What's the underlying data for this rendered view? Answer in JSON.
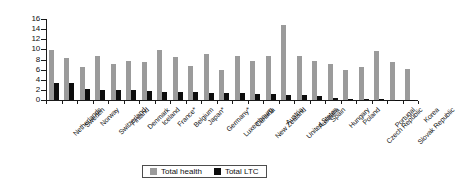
{
  "chart_data": {
    "type": "bar",
    "title": "",
    "subtitle": "",
    "xlabel": "",
    "ylabel": "",
    "ylim": [
      0,
      16
    ],
    "ytick_values": [
      0,
      2,
      4,
      6,
      8,
      10,
      12,
      14,
      16
    ],
    "ytick_labels": [
      "0",
      "2",
      "4",
      "6",
      "8",
      "10",
      "12",
      "14",
      "16"
    ],
    "grid": false,
    "legend_position": "bottom-center",
    "categories": [
      "Netherlands",
      "Sweden",
      "Norway",
      "Switzerland",
      "Finland",
      "Denmark",
      "Iceland",
      "France*",
      "Belgium",
      "Japan*",
      "Germany*",
      "Luxembourg",
      "Canada",
      "New Zealand",
      "Austria",
      "United States",
      "Australia",
      "Spain",
      "Hungary",
      "Poland",
      "Czech Republic",
      "Portugal",
      "Slovak Republic",
      "Korea"
    ],
    "series": [
      {
        "name": "Total health",
        "color": "#9b9b9b",
        "values": [
          9.8,
          8.3,
          6.6,
          8.6,
          7.2,
          7.7,
          7.5,
          9.8,
          8.5,
          6.8,
          9.0,
          5.9,
          8.6,
          7.8,
          8.7,
          14.9,
          8.7,
          7.7,
          7.1,
          5.9,
          6.5,
          9.6,
          7.5,
          6.1
        ]
      },
      {
        "name": "Total LTC",
        "color": "#0d0d0d",
        "values": [
          3.4,
          3.4,
          2.1,
          2.0,
          2.0,
          1.9,
          1.7,
          1.5,
          1.5,
          1.5,
          1.3,
          1.3,
          1.3,
          1.2,
          1.2,
          0.9,
          0.9,
          0.7,
          0.3,
          0.25,
          0.2,
          0.12,
          0.1,
          0.05
        ]
      }
    ]
  },
  "legend": {
    "entries": [
      {
        "label": "Total health",
        "swatch": "health-swatch"
      },
      {
        "label": "Total LTC",
        "swatch": "ltc-swatch"
      }
    ]
  }
}
